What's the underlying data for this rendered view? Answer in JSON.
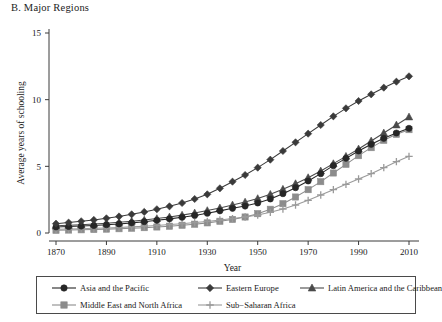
{
  "figure": {
    "panel_title": "B. Major Regions"
  },
  "chart_data": {
    "type": "line",
    "title": "B. Major Regions",
    "xlabel": "Year",
    "ylabel": "Average years of schooling",
    "xlim": [
      1870,
      2010
    ],
    "ylim": [
      0,
      15
    ],
    "xticks": [
      1870,
      1890,
      1910,
      1930,
      1950,
      1970,
      1990,
      2010
    ],
    "yticks": [
      0,
      5,
      10,
      15
    ],
    "xtick_labels": [
      "1870",
      "1890",
      "1910",
      "1930",
      "1950",
      "1970",
      "1990",
      "2010"
    ],
    "ytick_labels": [
      "0",
      "5",
      "10",
      "15"
    ],
    "grid": false,
    "legend_position": "bottom",
    "x": [
      1870,
      1875,
      1880,
      1885,
      1890,
      1895,
      1900,
      1905,
      1910,
      1915,
      1920,
      1925,
      1930,
      1935,
      1940,
      1945,
      1950,
      1955,
      1960,
      1965,
      1970,
      1975,
      1980,
      1985,
      1990,
      1995,
      2000,
      2005,
      2010
    ],
    "series": [
      {
        "name": "Asia and the Pacific",
        "marker": "circle",
        "color": "#262626",
        "values": [
          0.45,
          0.48,
          0.52,
          0.56,
          0.62,
          0.68,
          0.76,
          0.85,
          0.95,
          1.06,
          1.18,
          1.32,
          1.48,
          1.66,
          1.85,
          2.02,
          2.25,
          2.55,
          2.95,
          3.4,
          3.9,
          4.45,
          5.05,
          5.6,
          6.15,
          6.65,
          7.1,
          7.5,
          7.85
        ]
      },
      {
        "name": "Eastern Europe",
        "marker": "diamond",
        "color": "#3a3a3a",
        "values": [
          0.7,
          0.78,
          0.88,
          0.98,
          1.1,
          1.24,
          1.4,
          1.58,
          1.78,
          2.0,
          2.25,
          2.55,
          2.9,
          3.35,
          3.85,
          4.35,
          4.9,
          5.5,
          6.15,
          6.8,
          7.45,
          8.1,
          8.75,
          9.35,
          9.9,
          10.4,
          10.9,
          11.35,
          11.75
        ]
      },
      {
        "name": "Latin America and the Caribbean",
        "marker": "triangle",
        "color": "#4a4a4a",
        "values": [
          0.55,
          0.58,
          0.62,
          0.67,
          0.73,
          0.8,
          0.88,
          0.97,
          1.08,
          1.2,
          1.34,
          1.5,
          1.68,
          1.88,
          2.1,
          2.32,
          2.58,
          2.9,
          3.28,
          3.7,
          4.15,
          4.65,
          5.2,
          5.75,
          6.3,
          6.9,
          7.5,
          8.1,
          8.7
        ]
      },
      {
        "name": "Middle East and North Africa",
        "marker": "square",
        "color": "#8c8c8c",
        "values": [
          0.2,
          0.22,
          0.24,
          0.26,
          0.29,
          0.32,
          0.36,
          0.4,
          0.45,
          0.51,
          0.58,
          0.66,
          0.76,
          0.88,
          1.02,
          1.2,
          1.45,
          1.78,
          2.2,
          2.7,
          3.25,
          3.85,
          4.5,
          5.15,
          5.8,
          6.4,
          6.95,
          7.4,
          7.75
        ]
      },
      {
        "name": "Sub−Saharan Africa",
        "marker": "plus",
        "color": "#9a9a9a",
        "values": [
          0.28,
          0.3,
          0.32,
          0.35,
          0.38,
          0.42,
          0.46,
          0.51,
          0.57,
          0.63,
          0.7,
          0.78,
          0.87,
          0.97,
          1.08,
          1.2,
          1.35,
          1.55,
          1.8,
          2.1,
          2.45,
          2.85,
          3.25,
          3.65,
          4.05,
          4.45,
          4.9,
          5.35,
          5.75
        ]
      }
    ]
  },
  "legend": {
    "rows": [
      [
        {
          "label": "Asia and the Pacific",
          "marker": "circle",
          "color": "#262626",
          "offset": 14,
          "gap": 160
        },
        {
          "label": "Eastern Europe",
          "marker": "diamond",
          "color": "#3a3a3a",
          "offset": 160,
          "gap": 0
        },
        {
          "label": "Latin America and the Caribbean",
          "marker": "triangle",
          "color": "#4a4a4a",
          "offset": 262,
          "gap": 0
        }
      ],
      [
        {
          "label": "Middle East and North Africa",
          "marker": "square",
          "color": "#8c8c8c",
          "offset": 14,
          "gap": 0
        },
        {
          "label": "Sub−Saharan Africa",
          "marker": "plus",
          "color": "#9a9a9a",
          "offset": 160,
          "gap": 0
        }
      ]
    ]
  }
}
